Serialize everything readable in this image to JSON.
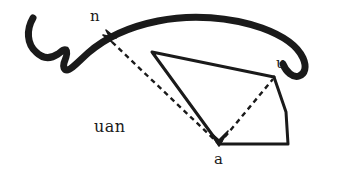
{
  "figure": {
    "title": "uan",
    "background_color": "#ffffff",
    "ink_color": "#1a1a1a",
    "width": 341,
    "height": 182,
    "labels": {
      "n": "n",
      "u": "u",
      "a": "a",
      "caption": "uan"
    },
    "vertices": {
      "n": {
        "x": 110,
        "y": 40
      },
      "u": {
        "x": 274,
        "y": 77
      },
      "a": {
        "x": 219,
        "y": 144
      },
      "t": {
        "x": 152,
        "y": 52
      },
      "br": {
        "x": 288,
        "y": 144
      }
    },
    "strokes": {
      "brush_arc": {
        "kind": "freehand-brush-arc",
        "stroke_width": 7,
        "color": "#1a1a1a",
        "path": "M 33 18 C 26 30, 27 44, 36 52 C 44 60, 52 58, 58 54 C 62 51, 64 49, 66 50 C 68 52, 66 58, 64 63 C 63 67, 64 70, 67 70 C 71 70, 78 62, 88 53 C 104 39, 128 27, 158 21 C 192 14, 230 17, 262 28 C 284 36, 298 47, 303 58 C 307 67, 305 74, 299 76 C 293 78, 286 72, 283 64"
      },
      "triangle": {
        "kind": "solid-polyline",
        "stroke_width": 3,
        "color": "#1a1a1a",
        "path": "M 152 52 L 274 77 M 152 52 L 219 144"
      },
      "quad": {
        "kind": "solid-polyline",
        "stroke_width": 3,
        "color": "#1a1a1a",
        "path": "M 274 77 L 286 112 L 288 144 L 219 144"
      },
      "dashed_n_a": {
        "kind": "dashed-line",
        "stroke_width": 2.4,
        "dash": "5 4",
        "color": "#1a1a1a",
        "path": "M 112 42 L 219 144"
      },
      "dashed_a_u": {
        "kind": "dashed-line",
        "stroke_width": 2.4,
        "dash": "5 4",
        "color": "#1a1a1a",
        "path": "M 219 144 L 273 79"
      },
      "arrow_n": {
        "kind": "arrowhead",
        "color": "#1a1a1a",
        "path": "M 112 42 L 103 35 L 116 38 L 106 30 Z"
      },
      "arrow_a": {
        "kind": "arrowhead",
        "color": "#1a1a1a",
        "path": "M 219 146 L 210 132 L 219 140 L 228 131 Z"
      }
    }
  }
}
